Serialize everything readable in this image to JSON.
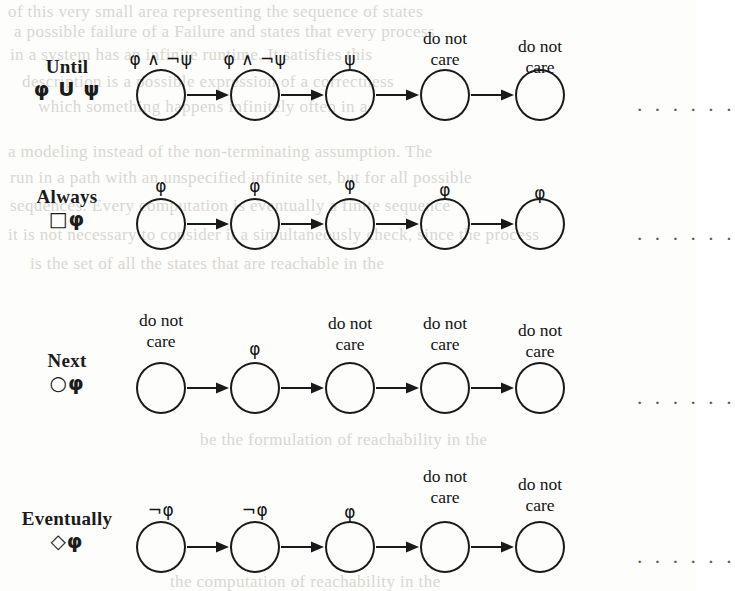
{
  "figure": {
    "ink_color": "#1a1a1a",
    "background_color": "#fdfdfc",
    "bleed_color": "#d9d7d2",
    "trailing_ellipsis": "· · · · · ·",
    "node_count_per_row": 5
  },
  "bleed_lines": [
    {
      "text": "of this very small area representing the sequence of states",
      "x": 8,
      "y": 2
    },
    {
      "text": "a possible failure of a Failure and  states that every process",
      "x": 14,
      "y": 22
    },
    {
      "text": "in a system has  an  infinite  runtime.  It  satisfies  this",
      "x": 10,
      "y": 45
    },
    {
      "text": "description is a possible expression of a correctness",
      "x": 22,
      "y": 72
    },
    {
      "text": "which   something   happens infinitely often in a",
      "x": 38,
      "y": 97
    },
    {
      "text": "a modeling instead of the non-terminating assumption. The",
      "x": 8,
      "y": 142
    },
    {
      "text": "run in a path with an unspecified infinite set,   but for all possible",
      "x": 10,
      "y": 168
    },
    {
      "text": "sequences.  Every computation is eventually a finite sequence",
      "x": 10,
      "y": 196
    },
    {
      "text": "it is not necessary to consider it a simultaneously check, since the process",
      "x": 8,
      "y": 225
    },
    {
      "text": "is the set of  all  the  states  that  are reachable in the",
      "x": 30,
      "y": 254
    },
    {
      "text": "be the formulation of reachability in the",
      "x": 200,
      "y": 430
    },
    {
      "text": "the computation of reachability in the",
      "x": 170,
      "y": 572
    }
  ],
  "rows": [
    {
      "id": "until",
      "name": "Until",
      "formula": "φ U ψ",
      "label_top": 56,
      "circle_center_y": 95,
      "nodes": [
        {
          "label": "φ ∧ ¬ψ",
          "kind": "sym",
          "label_y": 50
        },
        {
          "label": "φ ∧ ¬ψ",
          "kind": "sym",
          "label_y": 50
        },
        {
          "label": "ψ",
          "kind": "sym",
          "label_y": 50
        },
        {
          "label": "do not\ncare",
          "kind": "words",
          "label_y": 28
        },
        {
          "label": "do not\ncare",
          "kind": "words",
          "label_y": 36
        }
      ]
    },
    {
      "id": "always",
      "name": "Always",
      "formula": "□φ",
      "label_top": 186,
      "circle_center_y": 224,
      "nodes": [
        {
          "label": "φ",
          "kind": "sym",
          "label_y": 177
        },
        {
          "label": "φ",
          "kind": "sym",
          "label_y": 177
        },
        {
          "label": "φ",
          "kind": "sym",
          "label_y": 175
        },
        {
          "label": "φ",
          "kind": "sym",
          "label_y": 181
        },
        {
          "label": "φ",
          "kind": "sym",
          "label_y": 184
        }
      ]
    },
    {
      "id": "next",
      "name": "Next",
      "formula": "○φ",
      "label_top": 350,
      "circle_center_y": 388,
      "nodes": [
        {
          "label": "do not\ncare",
          "kind": "words",
          "label_y": 310
        },
        {
          "label": "φ",
          "kind": "sym",
          "label_y": 340
        },
        {
          "label": "do not\ncare",
          "kind": "words",
          "label_y": 313
        },
        {
          "label": "do not\ncare",
          "kind": "words",
          "label_y": 313
        },
        {
          "label": "do not\ncare",
          "kind": "words",
          "label_y": 320
        }
      ]
    },
    {
      "id": "eventually",
      "name": "Eventually",
      "formula": "◇φ",
      "label_top": 508,
      "circle_center_y": 547,
      "nodes": [
        {
          "label": "¬φ",
          "kind": "sym",
          "label_y": 501
        },
        {
          "label": "¬φ",
          "kind": "sym",
          "label_y": 501
        },
        {
          "label": "φ",
          "kind": "sym",
          "label_y": 503
        },
        {
          "label": "do not\ncare",
          "kind": "words",
          "label_y": 466
        },
        {
          "label": "do not\ncare",
          "kind": "words",
          "label_y": 474
        }
      ]
    }
  ],
  "geometry": {
    "node_x_centers": [
      161,
      255,
      350,
      445,
      540
    ],
    "node_diameter": 50,
    "dots_x": 636
  }
}
